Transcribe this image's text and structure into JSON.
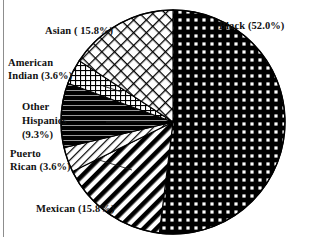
{
  "figure": {
    "kind": "pie-chart-figure",
    "background_color": "#ffffff",
    "border_color": "#8d8d8d"
  },
  "chart_data": {
    "type": "pie",
    "title": "",
    "subtitle": "",
    "xlabel": "",
    "ylabel": "",
    "grid": false,
    "legend_position": "none",
    "labels_position": "outside-with-leader",
    "start_angle_deg": 0,
    "direction": "clockwise",
    "center": {
      "x": 173,
      "y": 122
    },
    "radius": 112,
    "total_percent": 100.1,
    "categories": [
      "Black",
      "Mexican",
      "Puerto Rican",
      "Other Hispanics",
      "American Indian",
      "Asian"
    ],
    "values": [
      52.0,
      15.8,
      3.6,
      9.3,
      3.6,
      15.8
    ],
    "slices": [
      {
        "name": "Black",
        "value": 52.0,
        "percent_text": "52.0%",
        "label": "Black (52.0%)",
        "fill_pattern": "bold-square-grid",
        "fill_color": "#000000"
      },
      {
        "name": "Mexican",
        "value": 15.8,
        "percent_text": "15.8%",
        "label": "Mexican (15.8%)",
        "fill_pattern": "bold-diagonal-stripes",
        "fill_color": "#000000"
      },
      {
        "name": "Puerto Rican",
        "value": 3.6,
        "percent_text": "3.6%",
        "label": "Puerto Rican (3.6%)",
        "label_line1": "Puerto",
        "label_line2": "Rican (3.6%)",
        "fill_pattern": "thin-diagonal-hatch",
        "fill_color": "#000000"
      },
      {
        "name": "Other Hispanics",
        "value": 9.3,
        "percent_text": "9.3%",
        "label": "Other Hispanics (9.3%)",
        "label_line1": "Other",
        "label_line2": "Hispanics",
        "label_line3": "(9.3%)",
        "fill_pattern": "solid-black-thin-horizontal-lines",
        "fill_color": "#000000"
      },
      {
        "name": "American Indian",
        "value": 3.6,
        "percent_text": "3.6%",
        "label": "American Indian (3.6%)",
        "label_line1": "American",
        "label_line2": "Indian (3.6%)",
        "fill_pattern": "fine-square-grid",
        "fill_color": "#000000"
      },
      {
        "name": "Asian",
        "value": 15.8,
        "percent_text": "15.8%",
        "label": "Asian ( 15.8%)",
        "fill_pattern": "diagonal-crosshatch",
        "fill_color": "#000000"
      }
    ]
  },
  "labels": {
    "black": "Black (52.0%)",
    "asian": "Asian ( 15.8%)",
    "american_indian_line1": "American",
    "american_indian_line2": "Indian (3.6%)",
    "other_hispanics_line1": "Other",
    "other_hispanics_line2": "Hispanics",
    "other_hispanics_line3": "(9.3%)",
    "puerto_rican_line1": "Puerto",
    "puerto_rican_line2": "Rican (3.6%)",
    "mexican": "Mexican (15.8%)"
  }
}
